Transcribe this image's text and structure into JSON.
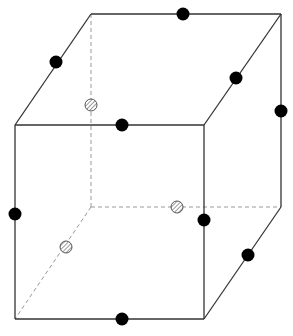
{
  "diagram": {
    "type": "cube-with-points",
    "colors": {
      "edge": "#333333",
      "hidden_edge": "#999999",
      "solid_dot": "#000000",
      "hatched_dot_stroke": "#555555",
      "background": "#ffffff"
    },
    "vertices": {
      "front_top_left": [
        15,
        125
      ],
      "front_top_right": [
        204,
        125
      ],
      "front_bottom_left": [
        15,
        319
      ],
      "front_bottom_right": [
        204,
        319
      ],
      "back_top_left": [
        91,
        14
      ],
      "back_top_right": [
        281,
        14
      ],
      "back_bottom_left": [
        91,
        207
      ],
      "back_bottom_right": [
        281,
        207
      ]
    },
    "solid_points": [
      {
        "x": 183,
        "y": 14
      },
      {
        "x": 56,
        "y": 62
      },
      {
        "x": 236,
        "y": 78
      },
      {
        "x": 281,
        "y": 111
      },
      {
        "x": 122,
        "y": 125
      },
      {
        "x": 15,
        "y": 214
      },
      {
        "x": 204,
        "y": 220
      },
      {
        "x": 248,
        "y": 255
      },
      {
        "x": 122,
        "y": 319
      }
    ],
    "hatched_points": [
      {
        "x": 91,
        "y": 105
      },
      {
        "x": 177,
        "y": 207
      },
      {
        "x": 66,
        "y": 247
      }
    ]
  }
}
